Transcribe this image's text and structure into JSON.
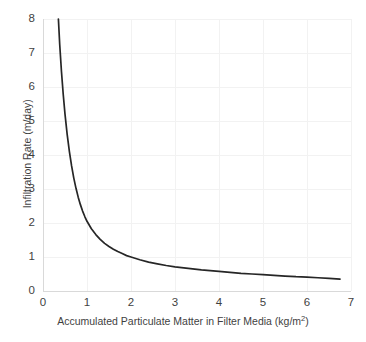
{
  "chart_data": {
    "type": "line",
    "title": "",
    "subtitle": "",
    "xlabel": "Accumulated Particulate Matter in Filter Media (kg/m2)",
    "xlabel_prefix": "Accumulated Particulate Matter in Filter Media (kg/m",
    "xlabel_exponent": "2",
    "xlabel_suffix": ")",
    "ylabel": "Infiltration Rate (m/day)",
    "xlim": [
      0,
      7
    ],
    "ylim": [
      0,
      8
    ],
    "xticks": [
      0,
      1,
      2,
      3,
      4,
      5,
      6,
      7
    ],
    "xtick_labels": [
      "0",
      "1",
      "2",
      "3",
      "4",
      "5",
      "6",
      "7"
    ],
    "yticks": [
      0,
      1,
      2,
      3,
      4,
      5,
      6,
      7,
      8
    ],
    "ytick_labels": [
      "0",
      "1",
      "2",
      "3",
      "4",
      "5",
      "6",
      "7",
      "8"
    ],
    "grid": true,
    "grid_color": "#f2f2f2",
    "axis_color": "#d9d9d9",
    "legend": false,
    "legend_position": "none",
    "series": [
      {
        "name": "Infiltration Rate",
        "color": "#262626",
        "line_width": 1.7,
        "marker": "none",
        "x": [
          0.35,
          0.38,
          0.42,
          0.46,
          0.5,
          0.55,
          0.6,
          0.65,
          0.7,
          0.75,
          0.8,
          0.85,
          0.9,
          0.95,
          1.0,
          1.1,
          1.2,
          1.3,
          1.4,
          1.5,
          1.6,
          1.7,
          1.8,
          1.9,
          2.0,
          2.2,
          2.4,
          2.6,
          2.8,
          3.0,
          3.2,
          3.4,
          3.6,
          3.8,
          4.0,
          4.25,
          4.5,
          4.75,
          5.0,
          5.25,
          5.5,
          5.75,
          6.0,
          6.25,
          6.5,
          6.75
        ],
        "y": [
          8.0,
          7.25,
          6.45,
          5.78,
          5.2,
          4.6,
          4.1,
          3.68,
          3.32,
          3.02,
          2.76,
          2.54,
          2.35,
          2.19,
          2.05,
          1.83,
          1.66,
          1.52,
          1.4,
          1.31,
          1.23,
          1.16,
          1.1,
          1.04,
          1.0,
          0.92,
          0.85,
          0.8,
          0.75,
          0.71,
          0.68,
          0.65,
          0.62,
          0.6,
          0.58,
          0.55,
          0.52,
          0.5,
          0.48,
          0.46,
          0.44,
          0.42,
          0.41,
          0.39,
          0.37,
          0.35
        ]
      }
    ]
  },
  "plot_geometry": {
    "left": 43,
    "right": 351,
    "top": 19,
    "bottom": 291
  }
}
